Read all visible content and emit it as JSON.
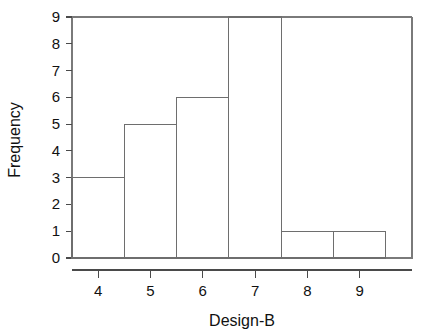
{
  "chart_data": {
    "type": "bar",
    "subtype": "histogram",
    "title": "",
    "xlabel": "Design-B",
    "ylabel": "Frequency",
    "categories": [
      "4",
      "5",
      "6",
      "7",
      "8",
      "9"
    ],
    "bin_centers": [
      4,
      5,
      6,
      7,
      8,
      9
    ],
    "bin_edges": [
      3.5,
      4.5,
      5.5,
      6.5,
      7.5,
      8.5,
      9.5
    ],
    "values": [
      3,
      5,
      6,
      9,
      1,
      1
    ],
    "total_count": 25,
    "xlim": [
      3.5,
      10.0
    ],
    "ylim": [
      0,
      9
    ],
    "x_ticks": [
      4,
      5,
      6,
      7,
      8,
      9
    ],
    "y_ticks": [
      0,
      1,
      2,
      3,
      4,
      5,
      6,
      7,
      8,
      9
    ],
    "x_tick_labels": [
      "4",
      "5",
      "6",
      "7",
      "8",
      "9"
    ],
    "y_tick_labels": [
      "0",
      "1",
      "2",
      "3",
      "4",
      "5",
      "6",
      "7",
      "8",
      "9"
    ],
    "grid": false,
    "legend": false,
    "legend_position": "none",
    "bar_fill_color": "#ffffff",
    "bar_edge_color": "#6e6e6e",
    "axis_color": "#4a4a4a",
    "background_color": "#ffffff"
  }
}
